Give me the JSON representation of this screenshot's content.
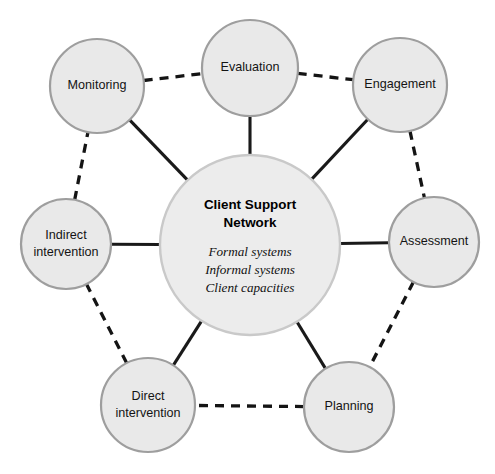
{
  "diagram": {
    "canvas": {
      "width": 495,
      "height": 474,
      "background": "#ffffff"
    },
    "colors": {
      "node_fill": "#e9e9e9",
      "node_stroke": "#9e9e9e",
      "center_fill": "#ececec",
      "center_stroke": "#c9c9c9",
      "edge_solid": "#1a1a1a",
      "edge_dashed": "#141414",
      "text": "#141414"
    },
    "center_node": {
      "id": "client-support-network",
      "title_line_1": "Client Support",
      "title_line_2": "Network",
      "subitems": [
        "Formal systems",
        "Informal systems",
        "Client capacities"
      ],
      "cx": 250,
      "cy": 245,
      "r": 90
    },
    "nodes": [
      {
        "id": "monitoring",
        "label_line_1": "Monitoring",
        "label_line_2": "",
        "cx": 97,
        "cy": 86,
        "r": 47
      },
      {
        "id": "evaluation",
        "label_line_1": "Evaluation",
        "label_line_2": "",
        "cx": 250,
        "cy": 68,
        "r": 48
      },
      {
        "id": "engagement",
        "label_line_1": "Engagement",
        "label_line_2": "",
        "cx": 400,
        "cy": 85,
        "r": 47
      },
      {
        "id": "assessment",
        "label_line_1": "Assessment",
        "label_line_2": "",
        "cx": 434,
        "cy": 242,
        "r": 45
      },
      {
        "id": "planning",
        "label_line_1": "Planning",
        "label_line_2": "",
        "cx": 349,
        "cy": 407,
        "r": 45
      },
      {
        "id": "direct-intervention",
        "label_line_1": "Direct",
        "label_line_2": "intervention",
        "cx": 148,
        "cy": 405,
        "r": 47
      },
      {
        "id": "indirect-intervention",
        "label_line_1": "Indirect",
        "label_line_2": "intervention",
        "cx": 66,
        "cy": 244,
        "r": 45
      }
    ],
    "edges_solid": [
      {
        "id": "edge-monitoring-center",
        "from": "monitoring",
        "to": "client-support-network"
      },
      {
        "id": "edge-evaluation-center",
        "from": "evaluation",
        "to": "client-support-network"
      },
      {
        "id": "edge-engagement-center",
        "from": "engagement",
        "to": "client-support-network"
      },
      {
        "id": "edge-assessment-center",
        "from": "assessment",
        "to": "client-support-network"
      },
      {
        "id": "edge-planning-center",
        "from": "planning",
        "to": "client-support-network"
      },
      {
        "id": "edge-direct-center",
        "from": "direct-intervention",
        "to": "client-support-network"
      },
      {
        "id": "edge-indirect-center",
        "from": "indirect-intervention",
        "to": "client-support-network"
      }
    ],
    "edges_dashed": [
      {
        "id": "edge-monitoring-evaluation",
        "from": "monitoring",
        "to": "evaluation"
      },
      {
        "id": "edge-evaluation-engagement",
        "from": "evaluation",
        "to": "engagement"
      },
      {
        "id": "edge-engagement-assessment",
        "from": "engagement",
        "to": "assessment"
      },
      {
        "id": "edge-assessment-planning",
        "from": "assessment",
        "to": "planning"
      },
      {
        "id": "edge-planning-direct",
        "from": "planning",
        "to": "direct-intervention"
      },
      {
        "id": "edge-direct-indirect",
        "from": "direct-intervention",
        "to": "indirect-intervention"
      },
      {
        "id": "edge-indirect-monitoring",
        "from": "indirect-intervention",
        "to": "monitoring"
      }
    ]
  }
}
